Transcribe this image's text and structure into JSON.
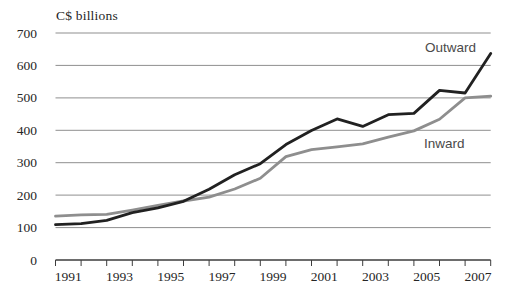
{
  "figure": {
    "unit_label": "C$ billions"
  },
  "chart_data": {
    "type": "line",
    "title": "C$ billions",
    "xlabel": "",
    "ylabel": "C$ billions",
    "x": [
      1991,
      1992,
      1993,
      1994,
      1995,
      1996,
      1997,
      1998,
      1999,
      2000,
      2001,
      2002,
      2003,
      2004,
      2005,
      2006,
      2007,
      2008
    ],
    "x_axis_tick_labels": [
      "1991",
      "1993",
      "1995",
      "1997",
      "1999",
      "2001",
      "2003",
      "2005",
      "2007"
    ],
    "yticks": [
      0,
      100,
      200,
      300,
      400,
      500,
      600,
      700
    ],
    "ylim": [
      0,
      700
    ],
    "grid": "horizontal-gridlines-only",
    "legend": "inline-series-labels",
    "series": [
      {
        "name": "Outward",
        "color": "#212121",
        "values": [
          109,
          112,
          122,
          146,
          161,
          181,
          218,
          263,
          297,
          356,
          399,
          435,
          412,
          448,
          452,
          523,
          515,
          637
        ]
      },
      {
        "name": "Inward",
        "color": "#8e8e8e",
        "values": [
          135,
          139,
          141,
          154,
          168,
          182,
          194,
          219,
          252,
          319,
          340,
          349,
          358,
          379,
          398,
          434,
          500,
          505
        ]
      }
    ],
    "annotations": [
      {
        "text": "Outward",
        "x": 476,
        "y": 52,
        "anchor": "end"
      },
      {
        "text": "Inward",
        "x": 424,
        "y": 148,
        "anchor": "start"
      }
    ]
  },
  "style": {
    "grid_color": "#8f8f8f",
    "axis_color": "#3d3d3d",
    "tick_label_color": "#262626",
    "annotation_color": "#4a4a4a",
    "background": "#ffffff",
    "line_width": 2.8
  }
}
